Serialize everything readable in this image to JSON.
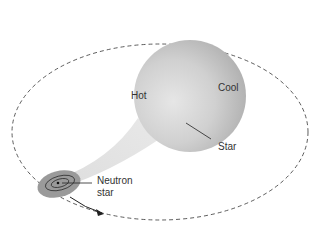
{
  "diagram": {
    "labels": {
      "hot": "Hot",
      "cool": "Cool",
      "star": "Star",
      "neutron_star_line1": "Neutron",
      "neutron_star_line2": "star"
    }
  }
}
